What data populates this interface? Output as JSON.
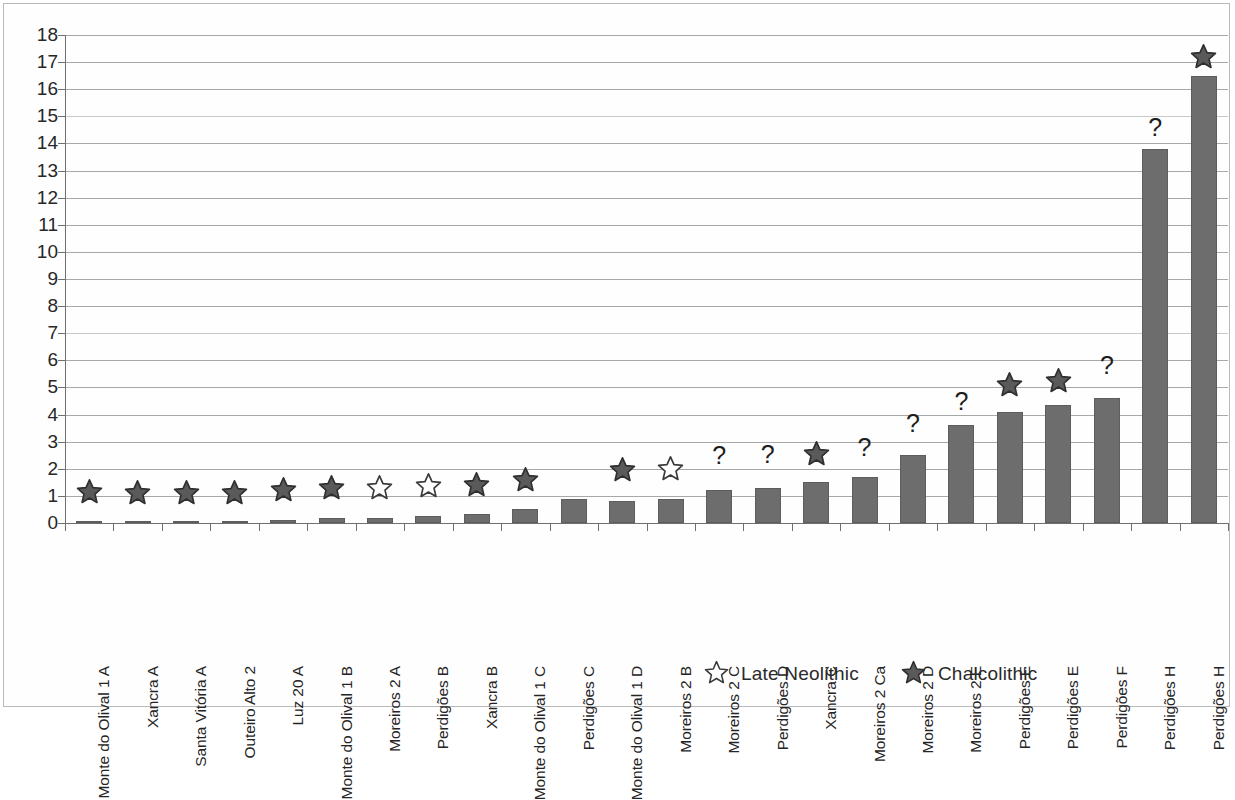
{
  "chart_data": {
    "type": "bar",
    "title": "",
    "xlabel": "",
    "ylabel": "",
    "ylim": [
      0,
      18
    ],
    "ytick_step": 1,
    "grid": true,
    "yticks": [
      "18",
      "17",
      "16",
      "15",
      "14",
      "13",
      "12",
      "11",
      "10",
      "9",
      "8",
      "7",
      "6",
      "5",
      "4",
      "3",
      "2",
      "1",
      "0"
    ],
    "categories": [
      "Monte do Olival 1 A",
      "Xancra A",
      "Santa Vitória A",
      "Outeiro Alto 2",
      "Luz 20 A",
      "Monte do Olival 1 B",
      "Moreiros 2 A",
      "Perdigões B",
      "Xancra B",
      "Monte do Olival 1 C",
      "Perdigões C",
      "Monte do Olival 1 D",
      "Moreiros 2 B",
      "Moreiros 2 C",
      "Perdigões D",
      "Xancra C",
      "Moreiros 2 Ca",
      "Moreiros 2 D",
      "Moreiros 2 E",
      "Perdigões E",
      "Perdigões E",
      "Perdigões F",
      "Perdigões H",
      "Perdigões H"
    ],
    "values": [
      0.03,
      0.03,
      0.04,
      0.04,
      0.12,
      0.18,
      0.2,
      0.25,
      0.35,
      0.5,
      0.9,
      0.82,
      0.9,
      1.2,
      1.3,
      1.5,
      1.7,
      2.5,
      3.6,
      4.1,
      4.35,
      4.6,
      13.8,
      16.5
    ],
    "markers": [
      "chalcolithic",
      "chalcolithic",
      "chalcolithic",
      "chalcolithic",
      "chalcolithic",
      "chalcolithic",
      "late-neolithic",
      "late-neolithic",
      "chalcolithic",
      "chalcolithic",
      "none",
      "chalcolithic",
      "late-neolithic",
      "unknown",
      "unknown",
      "chalcolithic",
      "unknown",
      "unknown",
      "unknown",
      "chalcolithic",
      "chalcolithic",
      "unknown",
      "unknown",
      "chalcolithic"
    ],
    "marker_values": [
      1.15,
      1.1,
      1.1,
      1.1,
      1.2,
      1.3,
      1.3,
      1.35,
      1.4,
      1.6,
      null,
      1.95,
      2.0,
      2.2,
      2.25,
      2.55,
      2.5,
      3.4,
      4.2,
      5.1,
      5.25,
      5.55,
      14.3,
      17.2
    ],
    "series_name": "Count",
    "bar_color": "#6d6d6d",
    "grid_color": "#a8a8a8",
    "axis_color": "#6f6f6f"
  },
  "legend": {
    "position": "bottom",
    "items": [
      {
        "label": "Late Neolithic",
        "marker": "late-neolithic"
      },
      {
        "label": "Chalcolithic",
        "marker": "chalcolithic"
      }
    ]
  },
  "symbols": {
    "unknown": "?"
  }
}
